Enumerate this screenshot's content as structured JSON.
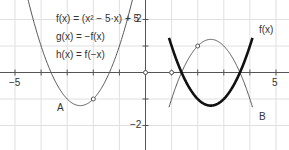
{
  "figure": {
    "definitions": [
      "f(x) = (x² − 5·x) + 5",
      "g(x) = −f(x)",
      "h(x) = f(−x)"
    ],
    "curve_labels": {
      "f": "f(x)",
      "A": "A",
      "B": "B"
    },
    "axis_ticks": {
      "x_min": "−5",
      "x_max": "5",
      "y_top": "2",
      "y_bottom": "−2"
    },
    "colors": {
      "grid": "#dddddd",
      "axis": "#555555",
      "f": "#111111",
      "g": "#555555",
      "h": "#555555"
    }
  },
  "chart_data": {
    "type": "line",
    "title": "",
    "xlabel": "",
    "ylabel": "",
    "xlim": [
      -5.3,
      5.3
    ],
    "ylim": [
      -2.8,
      2.7
    ],
    "grid": true,
    "series": [
      {
        "name": "f(x) = x² − 5x + 5",
        "style": "bold",
        "x_range": [
          0.9,
          4.1
        ]
      },
      {
        "name": "g(x) = −f(x)",
        "label": "B",
        "x_range": [
          0.9,
          4.1
        ]
      },
      {
        "name": "h(x) = f(−x)",
        "label": "A",
        "x_range": [
          -4.5,
          -0.5
        ]
      }
    ],
    "points": [
      {
        "x": 0,
        "y": 0
      },
      {
        "x": 1,
        "y": 0
      },
      {
        "x": 2,
        "y": 1
      },
      {
        "x": -2,
        "y": -1
      }
    ]
  }
}
